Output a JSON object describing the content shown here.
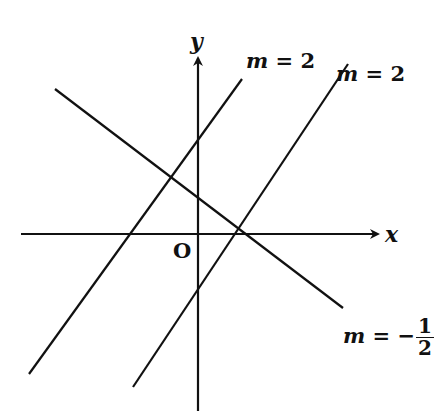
{
  "diagram": {
    "title": "",
    "axes": {
      "x_label": "x",
      "y_label": "y",
      "origin_label": "O"
    },
    "lines": [
      {
        "id": "line-1",
        "slope_label": "m = 2",
        "slope": 2,
        "x1": 29,
        "y1": 374,
        "x2": 242,
        "y2": 79
      },
      {
        "id": "line-2",
        "slope_label": "m = 2",
        "slope": 2,
        "x1": 133,
        "y1": 387,
        "x2": 348,
        "y2": 64
      },
      {
        "id": "line-3",
        "slope_label": "m = −1/2",
        "slope": -0.5,
        "x1": 55,
        "y1": 89,
        "x2": 343,
        "y2": 308
      }
    ],
    "labels": {
      "line1_m": "m",
      "line1_eq": " = 2",
      "line2_m": "m",
      "line2_eq": " = 2",
      "line3_m": "m",
      "line3_eq": " = −",
      "line3_num": "1",
      "line3_den": "2"
    },
    "colors": {
      "stroke": "#111111",
      "background": "#ffffff"
    }
  }
}
